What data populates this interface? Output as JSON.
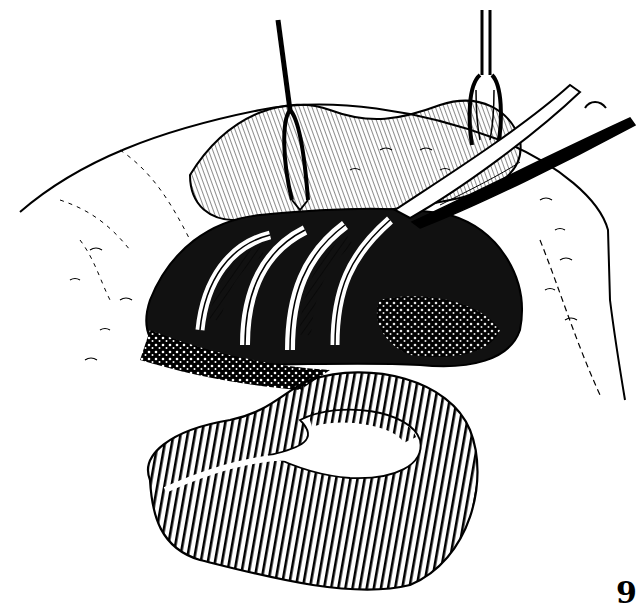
{
  "figure": {
    "figure_number": "9",
    "colors": {
      "ink": "#000000",
      "paper": "#ffffff"
    },
    "instruments": [
      {
        "name": "left-retractor"
      },
      {
        "name": "right-retractor"
      },
      {
        "name": "curved-clamp"
      }
    ]
  }
}
